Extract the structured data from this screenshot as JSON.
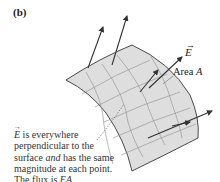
{
  "figure": {
    "panel_label": "(b)",
    "labels": {
      "field_vector": "E",
      "area_prefix": "Area ",
      "area_symbol": "A"
    },
    "caption": {
      "line1_symbol": "E",
      "line1_rest": " is everywhere",
      "line2": "perpendicular to the",
      "line3_pre": "surface ",
      "line3_em": "and",
      "line3_post": " has the same",
      "line4": "magnitude at each point.",
      "line5_pre": "The flux is ",
      "line5_em": "EA",
      "line5_post": "."
    },
    "colors": {
      "surface_fill": "#dedede",
      "surface_edge": "#4a4a4a",
      "grid": "#9a9a9a",
      "arrow": "#333333",
      "text": "#2a2a2a"
    }
  }
}
